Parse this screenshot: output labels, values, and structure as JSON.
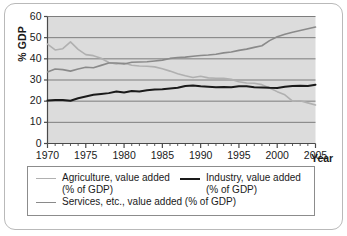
{
  "chart_data": {
    "type": "line",
    "title": "",
    "xlabel": "Year",
    "ylabel": "% GDP",
    "xlim": [
      1970,
      2005
    ],
    "ylim": [
      0,
      60
    ],
    "grid": "horizontal",
    "legend_position": "bottom",
    "x": [
      1970,
      1971,
      1972,
      1973,
      1974,
      1975,
      1976,
      1977,
      1978,
      1979,
      1980,
      1981,
      1982,
      1983,
      1984,
      1985,
      1986,
      1987,
      1988,
      1989,
      1990,
      1991,
      1992,
      1993,
      1994,
      1995,
      1996,
      1997,
      1998,
      1999,
      2000,
      2001,
      2002,
      2003,
      2004,
      2005
    ],
    "xticks": [
      1970,
      1975,
      1980,
      1985,
      1990,
      1995,
      2000,
      2005
    ],
    "xticklabels": [
      "1970",
      "1975",
      "1980",
      "1985",
      "1990",
      "1995",
      "2000",
      "2005"
    ],
    "yticks": [
      0,
      10,
      20,
      30,
      40,
      50,
      60
    ],
    "yticklabels": [
      "0",
      "10",
      "20",
      "30",
      "40",
      "50",
      "60"
    ],
    "series": [
      {
        "name": "Agriculture, value added\n(% of GDP)",
        "color": "#b0b0b0",
        "width": 1.6,
        "values": [
          47.0,
          44.2,
          44.8,
          48.0,
          44.5,
          42.0,
          41.5,
          40.3,
          38.3,
          37.6,
          38.0,
          37.0,
          36.6,
          36.5,
          36.2,
          35.3,
          34.2,
          33.0,
          32.0,
          31.2,
          31.8,
          31.0,
          30.8,
          30.8,
          30.3,
          29.2,
          28.6,
          28.5,
          27.8,
          26.2,
          24.5,
          23.0,
          20.0,
          20.2,
          19.2,
          18.2
        ]
      },
      {
        "name": "Industry, value added\n(% of GDP)",
        "color": "#1a1a1a",
        "width": 2.0,
        "values": [
          20.3,
          20.5,
          20.6,
          20.2,
          21.4,
          22.2,
          23.0,
          23.4,
          23.8,
          24.6,
          24.1,
          24.8,
          24.6,
          25.2,
          25.5,
          25.6,
          26.0,
          26.3,
          27.2,
          27.4,
          27.0,
          26.8,
          26.6,
          26.7,
          26.6,
          27.0,
          27.0,
          26.6,
          26.5,
          26.3,
          26.2,
          26.8,
          27.2,
          27.3,
          27.2,
          27.8
        ]
      },
      {
        "name": "Services, etc., value added (% of GDP)",
        "color": "#8a8a8a",
        "width": 1.6,
        "values": [
          33.8,
          35.2,
          34.9,
          34.2,
          35.2,
          36.0,
          35.8,
          36.9,
          38.0,
          38.0,
          37.6,
          38.4,
          38.5,
          38.6,
          39.0,
          39.4,
          40.2,
          40.6,
          40.8,
          41.2,
          41.6,
          41.8,
          42.2,
          42.8,
          43.2,
          44.0,
          44.6,
          45.4,
          46.2,
          48.6,
          50.4,
          51.6,
          52.6,
          53.4,
          54.2,
          55.0
        ]
      }
    ]
  },
  "axes": {
    "y_title": "% GDP",
    "x_title": "Year"
  },
  "legend": {
    "entries": [
      {
        "label": "Agriculture, value added\n(% of GDP)",
        "color": "#b0b0b0",
        "width": 1.6
      },
      {
        "label": "Industry, value added\n(% of GDP)",
        "color": "#1a1a1a",
        "width": 2.2
      },
      {
        "label": "Services, etc., value added (% of GDP)",
        "color": "#8a8a8a",
        "width": 1.6
      }
    ]
  },
  "style": {
    "plot_background": "#dcdcdc",
    "gridline_color": "#7d7d7d",
    "axis_color": "#4a4a4a",
    "frame_color": "#b9b9b9",
    "text_color": "#1a1a1a"
  }
}
